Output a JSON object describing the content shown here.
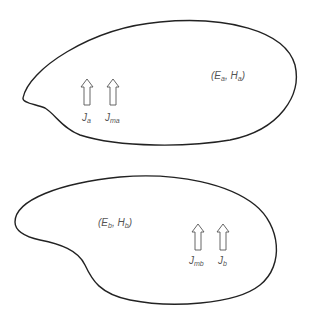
{
  "diagram": {
    "regions": [
      {
        "id": "a",
        "field_label": {
          "open": "(",
          "e": "E",
          "e_sub": "a",
          "sep": ", ",
          "h": "H",
          "h_sub": "a",
          "close": ")"
        },
        "sources": [
          {
            "base": "J",
            "sub": "a"
          },
          {
            "base": "J",
            "sub": "ma"
          }
        ]
      },
      {
        "id": "b",
        "field_label": {
          "open": "(",
          "e": "E",
          "e_sub": "b",
          "sep": ", ",
          "h": "H",
          "h_sub": "b",
          "close": ")"
        },
        "sources": [
          {
            "base": "J",
            "sub": "mb"
          },
          {
            "base": "J",
            "sub": "b"
          }
        ]
      }
    ],
    "colors": {
      "outline": "#222222",
      "arrow": "#555555",
      "text": "#555555",
      "background": "#ffffff"
    }
  }
}
